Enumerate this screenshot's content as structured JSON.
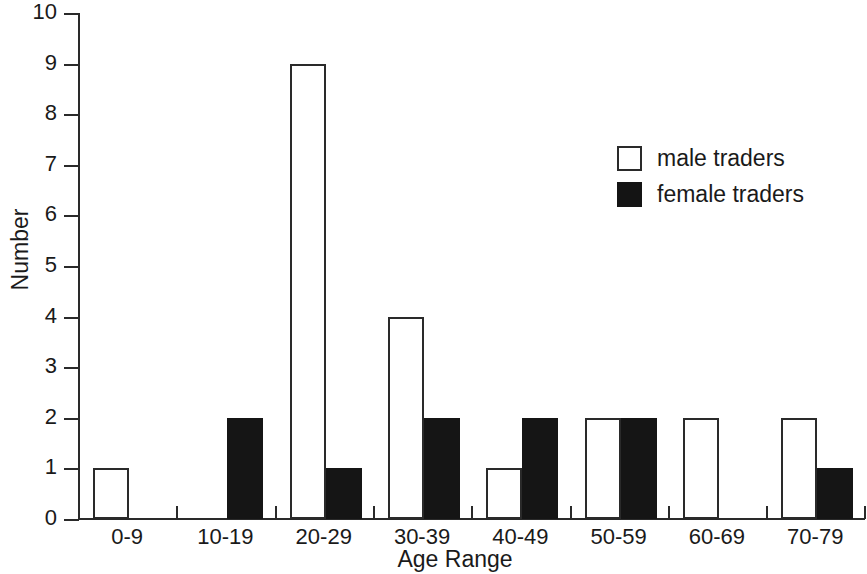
{
  "chart_data": {
    "type": "bar",
    "title": "",
    "subtitle": "",
    "xlabel": "Age Range",
    "ylabel": "Number",
    "categories": [
      "0-9",
      "10-19",
      "20-29",
      "30-39",
      "40-49",
      "50-59",
      "60-69",
      "70-79"
    ],
    "series": [
      {
        "name": "male traders",
        "values": [
          1,
          0,
          9,
          4,
          1,
          2,
          2,
          2
        ],
        "color": "#ffffff",
        "edge_color": "#2a2a2a"
      },
      {
        "name": "female traders",
        "values": [
          0,
          2,
          1,
          2,
          2,
          2,
          0,
          1
        ],
        "color": "#141414",
        "edge_color": "#141414"
      }
    ],
    "ylim": [
      0,
      10
    ],
    "y_ticks": [
      "0",
      "1",
      "2",
      "3",
      "4",
      "5",
      "6",
      "7",
      "8",
      "9",
      "10"
    ],
    "grid": false,
    "legend_position": "upper right",
    "legend_entries": [
      "male traders",
      "female traders"
    ],
    "annotations": []
  },
  "axes": {
    "y_title": "Number",
    "x_title": "Age Range"
  },
  "legend": {
    "items": [
      {
        "label": "male traders",
        "swatch": "white-square-swatch"
      },
      {
        "label": "female traders",
        "swatch": "black-square-swatch"
      }
    ]
  }
}
